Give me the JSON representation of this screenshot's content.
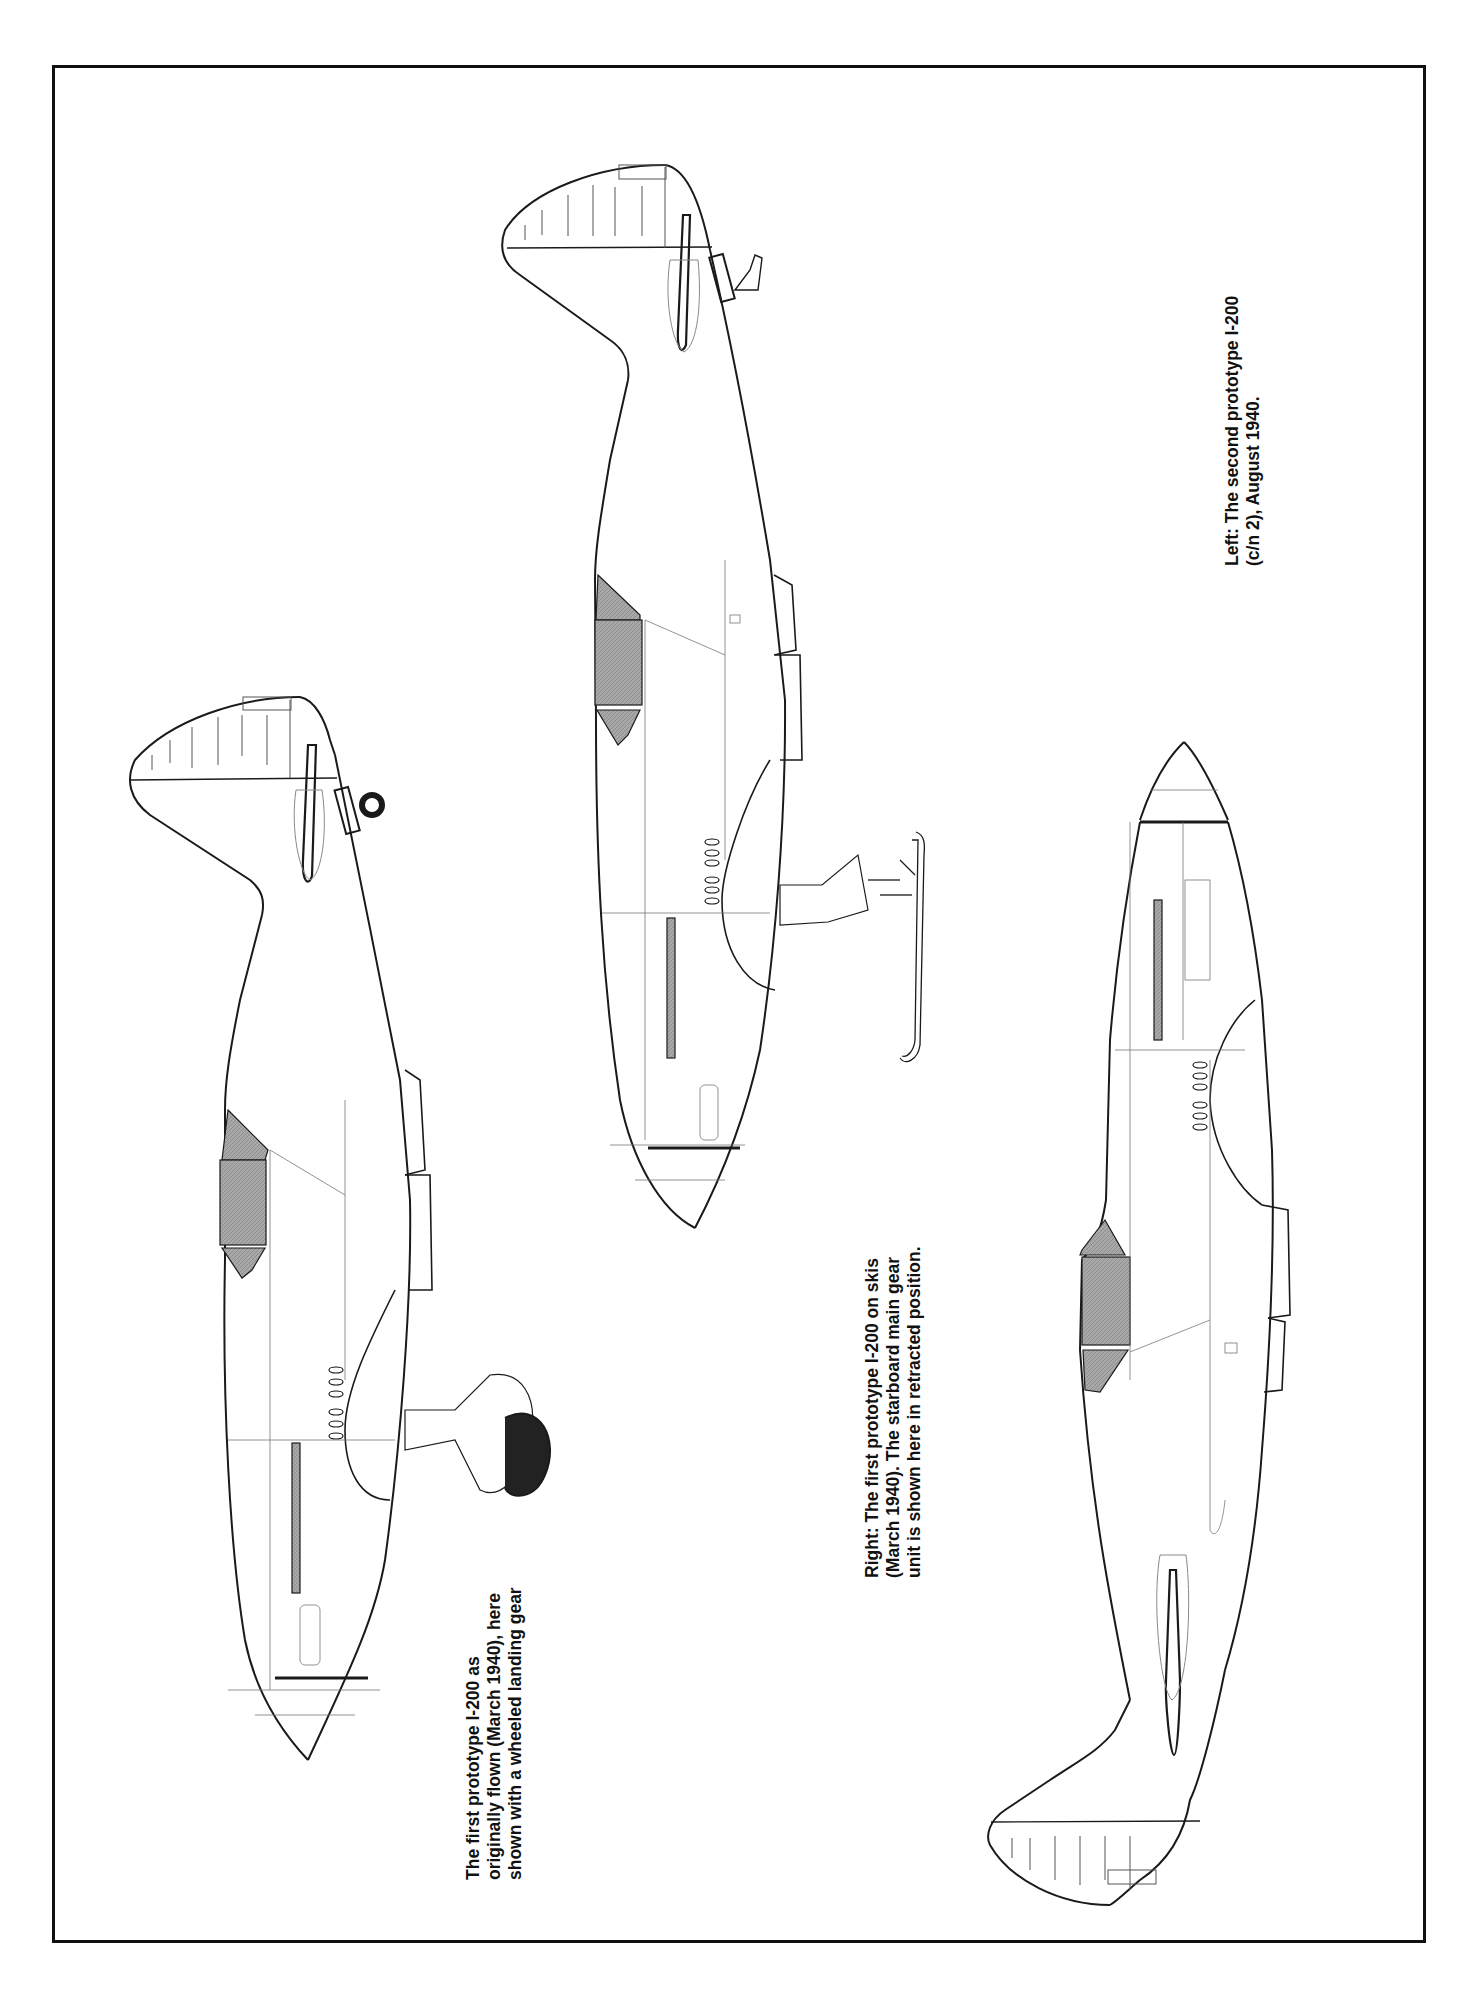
{
  "page": {
    "frame_border_color": "#111111",
    "background": "#ffffff",
    "line_color": "#1a1a1a",
    "hatch_color": "#9a9a9a"
  },
  "figures": [
    {
      "id": "left-aircraft",
      "subject": "First prototype I-200, wheeled landing gear",
      "orientation": "nose-down, rotated 90deg",
      "caption": {
        "lines": [
          "The first prototype I-200 as",
          "originally flown (March 1940), here",
          "shown with a wheeled landing gear"
        ]
      }
    },
    {
      "id": "center-aircraft",
      "subject": "First prototype I-200 on skis",
      "orientation": "nose-down, rotated 90deg",
      "caption": {
        "lines": [
          "Right: The first prototype I-200 on skis",
          "(March 1940). The starboard main gear",
          "unit is shown here in retracted position."
        ]
      }
    },
    {
      "id": "right-aircraft",
      "subject": "Second prototype I-200 (c/n 2)",
      "orientation": "nose-up, rotated 90deg",
      "caption": {
        "lines": [
          "Left: The second prototype I-200",
          "(c/n 2), August 1940."
        ]
      }
    }
  ]
}
